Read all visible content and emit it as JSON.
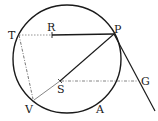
{
  "diagram": {
    "type": "geometry",
    "colors": {
      "ink": "#1a1a1a",
      "dashed": "#777777"
    },
    "circle": {
      "cx": 67,
      "cy": 59,
      "r": 54
    },
    "points": {
      "T": {
        "label": "T",
        "x": 19,
        "y": 35
      },
      "R": {
        "label": "R",
        "x": 52,
        "y": 35
      },
      "P": {
        "label": "P",
        "x": 114,
        "y": 34
      },
      "S": {
        "label": "S",
        "x": 60,
        "y": 81
      },
      "G": {
        "label": "G",
        "x": 138,
        "y": 81
      },
      "V": {
        "label": "V",
        "x": 34,
        "y": 100
      },
      "A": {
        "label": "A",
        "x": 100,
        "y": 112
      }
    },
    "segments": [
      {
        "from": "T",
        "to": "R",
        "style": "dotted"
      },
      {
        "from": "R",
        "to": "P",
        "style": "solid"
      },
      {
        "from": "P",
        "to": "S",
        "style": "solid"
      },
      {
        "from": "S",
        "to": "V",
        "style": "dotted"
      },
      {
        "from": "T",
        "to": "V",
        "style": "dash-dot"
      },
      {
        "from": "S",
        "to": "G",
        "style": "dash-dot"
      },
      {
        "from": "P",
        "to": "tangent-end",
        "style": "solid"
      }
    ]
  }
}
